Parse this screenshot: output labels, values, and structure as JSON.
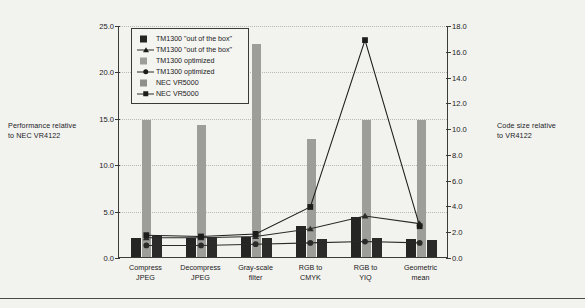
{
  "chart_data": {
    "type": "bar",
    "title": "",
    "subtitle": "",
    "categories": [
      "Compress\nJPEG",
      "Decompress\nJPEG",
      "Gray-scale\nfilter",
      "RGB to\nCMYK",
      "RGB to\nYIQ",
      "Geometric\nmean"
    ],
    "xlabel": "",
    "ylabel": "Performance relative to NEC VR4122",
    "y2label": "Code size relative to VR4122",
    "ylim": [
      0.0,
      25.0
    ],
    "y2lim": [
      0.0,
      18.0
    ],
    "yticks": [
      "0.0",
      "5.0",
      "10.0",
      "15.0",
      "20.0",
      "25.0"
    ],
    "ytick_values": [
      0.0,
      5.0,
      10.0,
      15.0,
      20.0,
      25.0
    ],
    "y2ticks": [
      "0.0",
      "2.0",
      "4.0",
      "6.0",
      "8.0",
      "10.0",
      "12.0",
      "14.0",
      "16.0",
      "18.0"
    ],
    "y2tick_values": [
      0.0,
      2.0,
      4.0,
      6.0,
      8.0,
      10.0,
      12.0,
      14.0,
      16.0,
      18.0
    ],
    "grid": true,
    "legend_position": "top-left-inside",
    "series": [
      {
        "name": "TM1300 \"out of the box\"",
        "kind": "bar",
        "axis": "left",
        "color": "#252524",
        "values": [
          2.1,
          2.0,
          2.2,
          3.3,
          4.3,
          1.9
        ]
      },
      {
        "name": "TM1300 optimized",
        "kind": "bar",
        "axis": "left",
        "color": "#9d9d99",
        "values": [
          14.8,
          14.2,
          23.0,
          12.7,
          14.8,
          14.8
        ]
      },
      {
        "name": "NEC VR5000",
        "kind": "bar",
        "axis": "left",
        "color": "#2b2b2a",
        "values": [
          2.3,
          2.2,
          2.1,
          1.9,
          2.0,
          1.8
        ]
      },
      {
        "name": "TM1300 \"out of the box\"",
        "kind": "line",
        "axis": "right",
        "marker": "triangle",
        "color": "#2a2a28",
        "values": [
          1.5,
          1.5,
          1.6,
          2.2,
          3.2,
          2.6
        ]
      },
      {
        "name": "TM1300 optimized",
        "kind": "line",
        "axis": "right",
        "marker": "circle",
        "color": "#2a2a28",
        "values": [
          0.9,
          0.9,
          1.0,
          1.1,
          1.2,
          1.1
        ]
      },
      {
        "name": "NEC VR5000",
        "kind": "line",
        "axis": "right",
        "marker": "square",
        "color": "#1c1c1b",
        "values": [
          1.7,
          1.6,
          1.8,
          3.9,
          16.9,
          2.4
        ]
      }
    ]
  },
  "axes": {
    "left_title": "Performance relative\nto NEC VR4122",
    "right_title": "Code size relative\nto VR4122"
  },
  "legend": {
    "items": [
      {
        "label": "TM1300 \"out of the box\"",
        "key": "swatch-black"
      },
      {
        "label": "TM1300 \"out of the box\"",
        "key": "line-triangle"
      },
      {
        "label": "TM1300 optimized",
        "key": "swatch-gray"
      },
      {
        "label": "TM1300 optimized",
        "key": "line-circle"
      },
      {
        "label": "NEC VR5000",
        "key": "swatch-gray-dark"
      },
      {
        "label": "NEC VR5000",
        "key": "line-square"
      }
    ]
  },
  "colors": {
    "background": "#f2f2ef",
    "bar_dark": "#252524",
    "bar_mid": "#9d9d99",
    "bar_dark2": "#2b2b2a",
    "line": "#2a2a28",
    "axis": "#3a3a38",
    "grid": "#b9b9b4"
  }
}
